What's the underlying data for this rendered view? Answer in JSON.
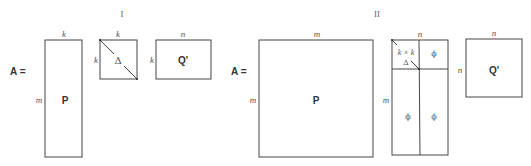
{
  "panels": [
    {
      "label": "I",
      "lhs": "A =",
      "P": {
        "name": "P",
        "top": "k",
        "left": "m"
      },
      "Delta": {
        "name": "Δ",
        "top": "k",
        "left": "k"
      },
      "Q": {
        "name": "Q'",
        "top": "n",
        "left": "k"
      }
    },
    {
      "label": "II",
      "lhs": "A =",
      "P": {
        "name": "P",
        "top": "m",
        "left": "m"
      },
      "Sigma": {
        "top": "n",
        "left": "m",
        "block_size": "k × k",
        "block_name": "Δ",
        "zero": "ϕ"
      },
      "Q": {
        "name": "Q'",
        "top": "n",
        "left": "n"
      }
    }
  ]
}
